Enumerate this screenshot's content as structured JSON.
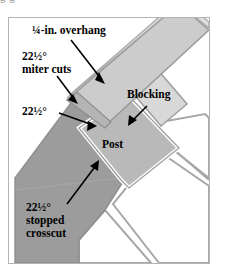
{
  "figure": {
    "frame": {
      "border_color": "#b4b4b4",
      "background": "#ffffff"
    },
    "clipped_caption_above": "g g",
    "labels": [
      {
        "id": "overhang",
        "text": "¼-in. overhang",
        "points_to": "top rail miter face",
        "has_arrow": true
      },
      {
        "id": "miter_cuts",
        "line1": "22½°",
        "line2": "miter cuts",
        "text": "22½° miter cuts",
        "points_to": "mitered rail end",
        "has_arrow": true
      },
      {
        "id": "angle_mid",
        "text": "22½°",
        "points_to": "angled cut on post shoulder",
        "has_arrow": true
      },
      {
        "id": "blocking",
        "text": "Blocking",
        "points_to": "blocking member",
        "has_arrow": true
      },
      {
        "id": "post",
        "text": "Post",
        "points_to": "post top",
        "has_arrow": false
      },
      {
        "id": "stopped_crosscut",
        "line1": "22½°",
        "line2": "stopped",
        "line3": "crosscut",
        "text": "22½° stopped crosscut",
        "points_to": "stopped crosscut on joist",
        "has_arrow": true
      }
    ],
    "colors": {
      "dark_gray_member": "#9c9c9c",
      "mid_gray_member": "#b9b9b9",
      "light_gray_member": "#cccccc",
      "pale_gray_member": "#d8d8d8",
      "outline": "#8e8e8e",
      "white_member": "#ffffff",
      "label_text": "#000000",
      "arrow": "#000000",
      "frame_border": "#b4b4b4"
    },
    "members": [
      {
        "id": "diagonal-joist",
        "name": "diagonal joist",
        "fill": "#9c9c9c"
      },
      {
        "id": "top-rail",
        "name": "top rail / cap",
        "fill": "#cccccc"
      },
      {
        "id": "blocking-member",
        "name": "blocking",
        "fill": "#d8d8d8"
      },
      {
        "id": "post-member",
        "name": "post",
        "fill": "#b9b9b9"
      },
      {
        "id": "deck-board-1",
        "name": "deck board",
        "fill": "#ffffff"
      },
      {
        "id": "deck-board-2",
        "name": "deck board",
        "fill": "#ffffff"
      },
      {
        "id": "deck-board-3",
        "name": "deck board",
        "fill": "#ffffff"
      }
    ]
  }
}
